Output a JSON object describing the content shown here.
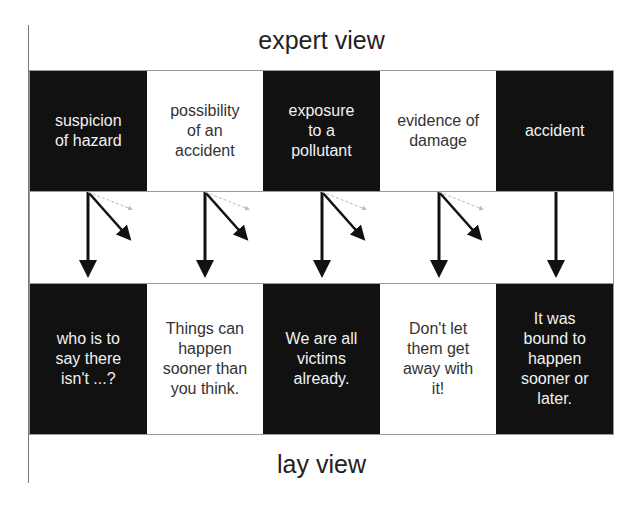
{
  "diagram": {
    "top_label": "expert view",
    "bottom_label": "lay view",
    "expert_boxes": [
      {
        "text": "suspicion\nof hazard",
        "style": "dark"
      },
      {
        "text": "possibility\nof an\naccident",
        "style": "light"
      },
      {
        "text": "exposure\nto a\npollutant",
        "style": "dark"
      },
      {
        "text": "evidence of\ndamage",
        "style": "light"
      },
      {
        "text": "accident",
        "style": "dark"
      }
    ],
    "lay_boxes": [
      {
        "text": "who is to\nsay there\nisn't ...?",
        "style": "dark"
      },
      {
        "text": "Things can\nhappen\nsooner than\nyou think.",
        "style": "light"
      },
      {
        "text": "We are all\nvictims\nalready.",
        "style": "dark"
      },
      {
        "text": "Don't let\nthem get\naway with\nit!",
        "style": "light"
      },
      {
        "text": "It was\nbound to\nhappen\nsooner or\nlater.",
        "style": "dark"
      }
    ],
    "arrows": [
      {
        "column": 1,
        "vertical": true,
        "diagonal": true,
        "faint_dashed": true
      },
      {
        "column": 2,
        "vertical": true,
        "diagonal": true,
        "faint_dashed": true
      },
      {
        "column": 3,
        "vertical": true,
        "diagonal": true,
        "faint_dashed": true
      },
      {
        "column": 4,
        "vertical": true,
        "diagonal": true,
        "faint_dashed": true
      },
      {
        "column": 5,
        "vertical": true,
        "diagonal": false,
        "faint_dashed": false
      }
    ]
  }
}
